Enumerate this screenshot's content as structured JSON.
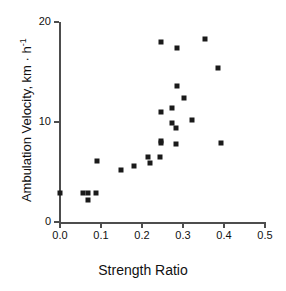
{
  "chart_data": {
    "type": "scatter",
    "title": "",
    "xlabel": "Strength Ratio",
    "ylabel": "Ambulation Velocity, km · h⁻¹",
    "ylabel_main": "Ambulation Velocity, km · h",
    "ylabel_exponent": "-1",
    "xlim": [
      0.0,
      0.5
    ],
    "ylim": [
      0,
      20
    ],
    "xticks": [
      0.0,
      0.1,
      0.2,
      0.3,
      0.4,
      0.5
    ],
    "xtick_labels": [
      "0.0",
      "0.1",
      "0.2",
      "0.3",
      "0.4",
      "0.5"
    ],
    "yticks": [
      0,
      10,
      20
    ],
    "ytick_labels": [
      "0",
      "10",
      "20"
    ],
    "grid": false,
    "legend": null,
    "marker": "square",
    "marker_color": "#1a1a1a",
    "marker_size_px": 5,
    "axis_color": "#4d4d4d",
    "points": [
      {
        "x": 0.0,
        "y": 2.9
      },
      {
        "x": 0.056,
        "y": 2.9
      },
      {
        "x": 0.068,
        "y": 2.9
      },
      {
        "x": 0.068,
        "y": 2.2
      },
      {
        "x": 0.088,
        "y": 2.9
      },
      {
        "x": 0.09,
        "y": 6.1
      },
      {
        "x": 0.149,
        "y": 5.2
      },
      {
        "x": 0.181,
        "y": 5.6
      },
      {
        "x": 0.215,
        "y": 6.5
      },
      {
        "x": 0.22,
        "y": 5.9
      },
      {
        "x": 0.244,
        "y": 6.5
      },
      {
        "x": 0.246,
        "y": 7.9
      },
      {
        "x": 0.246,
        "y": 8.1
      },
      {
        "x": 0.246,
        "y": 11.0
      },
      {
        "x": 0.246,
        "y": 18.0
      },
      {
        "x": 0.273,
        "y": 9.9
      },
      {
        "x": 0.273,
        "y": 11.4
      },
      {
        "x": 0.283,
        "y": 7.8
      },
      {
        "x": 0.283,
        "y": 9.4
      },
      {
        "x": 0.285,
        "y": 13.6
      },
      {
        "x": 0.285,
        "y": 17.4
      },
      {
        "x": 0.303,
        "y": 12.4
      },
      {
        "x": 0.322,
        "y": 10.2
      },
      {
        "x": 0.354,
        "y": 18.3
      },
      {
        "x": 0.386,
        "y": 15.4
      },
      {
        "x": 0.393,
        "y": 7.9
      }
    ]
  }
}
